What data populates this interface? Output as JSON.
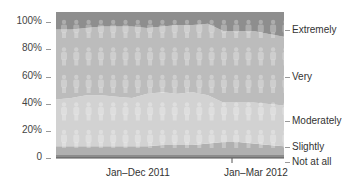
{
  "chart_data": {
    "type": "area",
    "stacked": true,
    "normalized": true,
    "title": "",
    "xlabel": "",
    "ylabel": "",
    "ylim": [
      0,
      100
    ],
    "yticks": [
      "100%",
      "80%",
      "60%",
      "40%",
      "20%",
      "0"
    ],
    "x_groups": [
      "Jan–Dec 2011",
      "Jan–Mar 2012"
    ],
    "x_points": 16,
    "series": [
      {
        "name": "Not at all",
        "color": "#8c8c8c",
        "values": [
          2,
          2,
          2,
          2,
          2,
          2,
          2,
          2,
          2,
          2,
          2,
          2,
          2,
          2,
          2,
          2
        ]
      },
      {
        "name": "Slightly",
        "color": "#b0b0b0",
        "values": [
          6,
          6,
          6,
          6,
          6,
          6,
          6,
          7,
          7,
          7,
          8,
          9,
          9,
          8,
          7,
          6
        ]
      },
      {
        "name": "Moderately",
        "color": "#d2d2d2",
        "values": [
          32,
          33,
          35,
          35,
          34,
          33,
          36,
          36,
          35,
          36,
          33,
          27,
          27,
          28,
          28,
          28
        ]
      },
      {
        "name": "Very",
        "color": "#bcbcbc",
        "values": [
          48,
          47,
          46,
          47,
          48,
          49,
          45,
          45,
          47,
          46,
          49,
          49,
          49,
          49,
          48,
          47
        ]
      },
      {
        "name": "Extremely",
        "color": "#8e8e8e",
        "values": [
          12,
          12,
          11,
          10,
          10,
          10,
          11,
          10,
          9,
          9,
          8,
          13,
          13,
          13,
          15,
          17
        ]
      }
    ],
    "legend_position": "right",
    "grid": false
  },
  "axis": {
    "y_labels": [
      "100%",
      "80%",
      "60%",
      "40%",
      "20%",
      "0"
    ],
    "x_labels": [
      "Jan–Dec 2011",
      "Jan–Mar 2012"
    ]
  },
  "legend": [
    "Extremely",
    "Very",
    "Moderately",
    "Slightly",
    "Not at all"
  ]
}
